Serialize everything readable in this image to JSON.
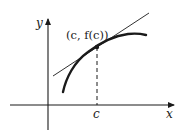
{
  "diagram": {
    "type": "tangent-line-illustration",
    "axes": {
      "x_label": "x",
      "y_label": "y"
    },
    "point_label": "(c, f(c))",
    "tick_label": "c",
    "elements": [
      "curve y=f(x)",
      "tangent line at x=c",
      "dashed vertical line from point to x-axis"
    ],
    "colors": {
      "line": "#1a1a1a",
      "background": "#ffffff"
    }
  }
}
